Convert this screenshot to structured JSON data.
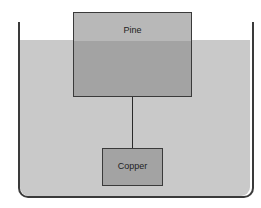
{
  "diagram": {
    "type": "buoyancy-illustration",
    "container": {
      "shape": "open-top tank with rounded bottom corners",
      "fluid_color": "#c9c9c9",
      "wall_color": "#3a3a3a"
    },
    "objects": [
      {
        "id": "pine",
        "label": "Pine",
        "description": "wooden block floating partially submerged at water surface",
        "color_above_water": "#b8b8b8",
        "color_below_water": "#a3a3a3"
      },
      {
        "id": "copper",
        "label": "Copper",
        "description": "copper block suspended below the pine block by a string, fully submerged",
        "color": "#a3a3a3"
      }
    ],
    "connector": {
      "type": "string",
      "from": "pine",
      "to": "copper"
    }
  }
}
